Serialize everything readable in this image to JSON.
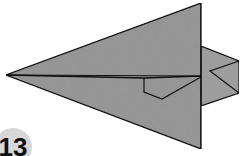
{
  "diagram": {
    "step_number": "13",
    "colors": {
      "paper": "#9a9a9a",
      "paper_back": "#a4a4a4",
      "line": "#111111",
      "step_badge": "#d8d8d8"
    }
  }
}
